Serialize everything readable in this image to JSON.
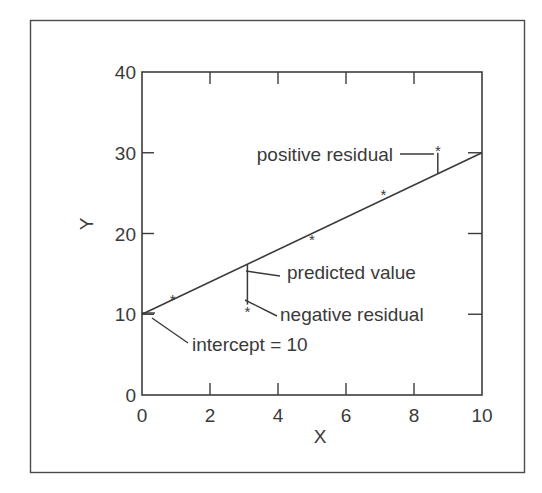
{
  "chart_data": {
    "type": "scatter",
    "title": "",
    "xlabel": "X",
    "ylabel": "Y",
    "xlim": [
      0,
      10
    ],
    "ylim": [
      0,
      40
    ],
    "grid": false,
    "x_ticks": [
      "0",
      "2",
      "4",
      "6",
      "8",
      "10"
    ],
    "y_ticks": [
      "0",
      "10",
      "20",
      "30",
      "40"
    ],
    "series": [
      {
        "name": "observed",
        "marker": "*",
        "points": [
          {
            "x": 0.9,
            "y": 12.0
          },
          {
            "x": 3.1,
            "y": 10.5
          },
          {
            "x": 5.0,
            "y": 19.5
          },
          {
            "x": 7.1,
            "y": 25.0
          },
          {
            "x": 8.7,
            "y": 30.5
          }
        ]
      },
      {
        "name": "regression line",
        "type": "line",
        "points": [
          {
            "x": 0,
            "y": 10
          },
          {
            "x": 10,
            "y": 30
          }
        ]
      }
    ],
    "residual_segments": [
      {
        "x": 3.1,
        "y_from": 16.2,
        "y_to": 11.2
      },
      {
        "x": 8.7,
        "y_from": 27.4,
        "y_to": 30.0
      }
    ],
    "annotations": [
      {
        "text": "positive residual",
        "points_to": {
          "x": 8.7,
          "y": 29.0
        }
      },
      {
        "text": "predicted value",
        "points_to": {
          "x": 3.1,
          "y": 16.2
        }
      },
      {
        "text": "negative residual",
        "points_to": {
          "x": 3.1,
          "y": 11.0
        }
      },
      {
        "text": "intercept = 10",
        "points_to": {
          "x": 0,
          "y": 10
        }
      }
    ],
    "legend": null
  }
}
